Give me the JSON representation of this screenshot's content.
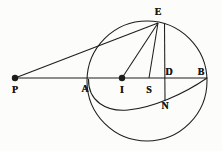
{
  "figure": {
    "kind": "geometry-diagram",
    "title": "",
    "canvas": {
      "width": 222,
      "height": 151
    },
    "ink_color": "#1d1d1b",
    "background_color": "#fcfcfa",
    "points": [
      {
        "id": "P",
        "label": "P",
        "x": 15,
        "y": 78,
        "label_x": 15,
        "label_y": 90,
        "marker": "filled-dot",
        "marker_r": 3.2
      },
      {
        "id": "A",
        "label": "A",
        "x": 88,
        "y": 79,
        "label_x": 85,
        "label_y": 89,
        "marker": "none",
        "marker_r": 0
      },
      {
        "id": "I",
        "label": "I",
        "x": 122,
        "y": 78,
        "label_x": 122,
        "label_y": 90,
        "marker": "filled-dot",
        "marker_r": 3.2
      },
      {
        "id": "S",
        "label": "S",
        "x": 149,
        "y": 78,
        "label_x": 149,
        "label_y": 90,
        "marker": "none",
        "marker_r": 0
      },
      {
        "id": "D",
        "label": "D",
        "x": 165,
        "y": 78,
        "label_x": 169,
        "label_y": 72,
        "marker": "none",
        "marker_r": 0
      },
      {
        "id": "B",
        "label": "B",
        "x": 207,
        "y": 78,
        "label_x": 201,
        "label_y": 72,
        "marker": "none",
        "marker_r": 0
      },
      {
        "id": "N",
        "label": "N",
        "x": 165,
        "y": 98,
        "label_x": 165,
        "label_y": 106,
        "marker": "none",
        "marker_r": 0
      },
      {
        "id": "E",
        "label": "E",
        "x": 158,
        "y": 23,
        "label_x": 158,
        "label_y": 12,
        "marker": "none",
        "marker_r": 0
      }
    ],
    "circle": {
      "cx": 147,
      "cy": 81,
      "r": 60
    },
    "ellipse_arc": {
      "from": "A",
      "to": "B",
      "description": "elliptical arc from A dipping below the horizontal axis through N to B"
    },
    "segments": [
      {
        "name": "P-E",
        "from": "P",
        "to": "E"
      },
      {
        "name": "P-B",
        "from": "P",
        "to": "B"
      },
      {
        "name": "E-I",
        "from": "E",
        "to": "I"
      },
      {
        "name": "E-S",
        "from": "E",
        "to": "S"
      },
      {
        "name": "E-N",
        "from": "E",
        "to": "N"
      },
      {
        "name": "B-ellipse-chord",
        "from": "B",
        "to": "ellipse"
      }
    ]
  }
}
